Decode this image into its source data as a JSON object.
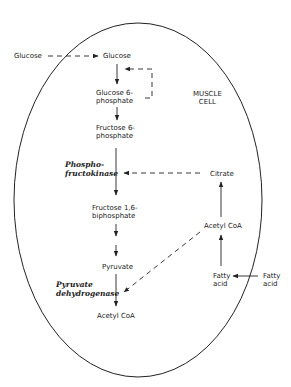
{
  "diagram": {
    "cell_label": "MUSCLE\nCELL",
    "nodes": {
      "glucose_outside": "Glucose",
      "glucose_inside": "Glucose",
      "glucose_6_phosphate": "Glucose 6-\nphosphate",
      "fructose_6_phosphate": "Fructose 6-\nphosphate",
      "fructose_1_6_biphosphate": "Fructose 1,6-\nbiphosphate",
      "pyruvate": "Pyruvate",
      "acetyl_coa_glycolysis": "Acetyl CoA",
      "citrate": "Citrate",
      "acetyl_coa_fatty": "Acetyl CoA",
      "fatty_acid_inside": "Fatty\nacid",
      "fatty_acid_outside": "Fatty\nacid"
    },
    "enzymes": {
      "phosphofructokinase": "Phospho-\nfructokinase",
      "pyruvate_dehydrogenase": "Pyruvate\ndehydrogenase"
    },
    "colors": {
      "line": "#222222",
      "background": "#ffffff"
    }
  }
}
